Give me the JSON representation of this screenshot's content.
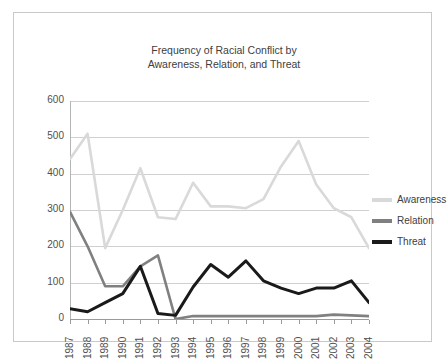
{
  "chart_data": {
    "type": "line",
    "title": "Frequency of Racial Conflict by Awareness, Relation, and Threat",
    "title_line1": "Frequency of Racial Conflict by",
    "title_line2": "Awareness, Relation, and Threat",
    "xlabel": "",
    "ylabel": "",
    "ylim": [
      0,
      600
    ],
    "yticks": [
      0,
      100,
      200,
      300,
      400,
      500,
      600
    ],
    "ytick_labels": [
      "0",
      "100",
      "200",
      "300",
      "400",
      "500",
      "600"
    ],
    "grid": true,
    "legend_position": "right",
    "categories": [
      "1987",
      "1988",
      "1989",
      "1990",
      "1991",
      "1992",
      "1993",
      "1994",
      "1995",
      "1996",
      "1997",
      "1998",
      "1999",
      "2000",
      "2001",
      "2002",
      "2003",
      "2004"
    ],
    "series": [
      {
        "name": "Awareness",
        "color": "#d9d9d9",
        "values": [
          440,
          510,
          195,
          300,
          415,
          280,
          275,
          375,
          310,
          310,
          305,
          330,
          420,
          490,
          370,
          305,
          280,
          195
        ]
      },
      {
        "name": "Relation",
        "color": "#808080",
        "values": [
          295,
          200,
          90,
          90,
          145,
          175,
          0,
          8,
          8,
          8,
          8,
          8,
          8,
          8,
          8,
          12,
          10,
          8
        ]
      },
      {
        "name": "Threat",
        "color": "#1a1a1a",
        "values": [
          28,
          20,
          45,
          70,
          145,
          15,
          10,
          88,
          150,
          115,
          160,
          105,
          85,
          70,
          85,
          85,
          105,
          45
        ]
      }
    ]
  },
  "legend": {
    "items": [
      {
        "label": "Awareness"
      },
      {
        "label": "Relation"
      },
      {
        "label": "Threat"
      }
    ]
  }
}
